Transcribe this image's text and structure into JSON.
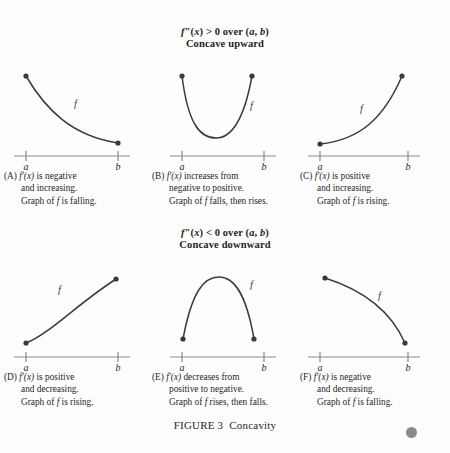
{
  "figure": {
    "number_label": "FIGURE 3",
    "title": "Concavity",
    "curve_color": "#3a3a3a",
    "axis_color": "#8c8c8c",
    "background_color": "#fdfdfd",
    "corner_dot_color": "#8b8b8b"
  },
  "sections": [
    {
      "id": "concave-upward",
      "condition_prefix": "f",
      "condition_primes": "″",
      "condition_var": "(x)",
      "condition_rest": " > 0 over (",
      "condition_a": "a",
      "condition_comma": ", ",
      "condition_b": "b",
      "condition_close": ")",
      "condition_full": "f″(x) > 0 over (a, b)",
      "name": "Concave upward"
    },
    {
      "id": "concave-downward",
      "condition_full": "f″(x) < 0 over (a, b)",
      "name": "Concave downward"
    }
  ],
  "axis": {
    "label_a": "a",
    "label_b": "b"
  },
  "curve_label": "f",
  "panels": [
    {
      "id": "A",
      "tag": "(A)",
      "line1_math": "f′(x)",
      "line1_text": " is negative",
      "line2": "and increasing.",
      "line3_pre": "Graph of ",
      "line3_it": "f",
      "line3_post": " is falling.",
      "shape": "decreasing-convex",
      "endpoint_dots": [
        "left",
        "right"
      ],
      "label_position": "upper-right-of-curve"
    },
    {
      "id": "B",
      "tag": "(B)",
      "line1_math": "f′(x)",
      "line1_text": " increases from",
      "line2": "negative to positive.",
      "line3_pre": "Graph of ",
      "line3_it": "f",
      "line3_post": " falls, then rises.",
      "shape": "u-parabola",
      "endpoint_dots": [
        "left",
        "right"
      ],
      "label_position": "right-branch"
    },
    {
      "id": "C",
      "tag": "(C)",
      "line1_math": "f′(x)",
      "line1_text": " is positive",
      "line2": "and increasing.",
      "line3_pre": "Graph of ",
      "line3_it": "f",
      "line3_post": " is rising.",
      "shape": "increasing-convex",
      "endpoint_dots": [
        "left",
        "right"
      ],
      "label_position": "upper-left-of-curve"
    },
    {
      "id": "D",
      "tag": "(D)",
      "line1_math": "f′(x)",
      "line1_text": " is positive",
      "line2": "and decreasing.",
      "line3_pre": "Graph of ",
      "line3_it": "f",
      "line3_post": " is rising.",
      "shape": "increasing-concave",
      "endpoint_dots": [
        "left",
        "right"
      ],
      "label_position": "above-curve"
    },
    {
      "id": "E",
      "tag": "(E)",
      "line1_math": "f′(x)",
      "line1_text": " decreases from",
      "line2": "positive to negative.",
      "line3_pre": "Graph of ",
      "line3_it": "f",
      "line3_post": " rises, then falls.",
      "shape": "inverted-parabola",
      "endpoint_dots": [
        "left",
        "right"
      ],
      "label_position": "right-branch"
    },
    {
      "id": "F",
      "tag": "(F)",
      "line1_math": "f′(x)",
      "line1_text": " is negative",
      "line2": "and decreasing.",
      "line3_pre": "Graph of ",
      "line3_it": "f",
      "line3_post": " is falling.",
      "shape": "decreasing-concave",
      "endpoint_dots": [
        "left",
        "right"
      ],
      "label_position": "upper-right-of-curve"
    }
  ]
}
